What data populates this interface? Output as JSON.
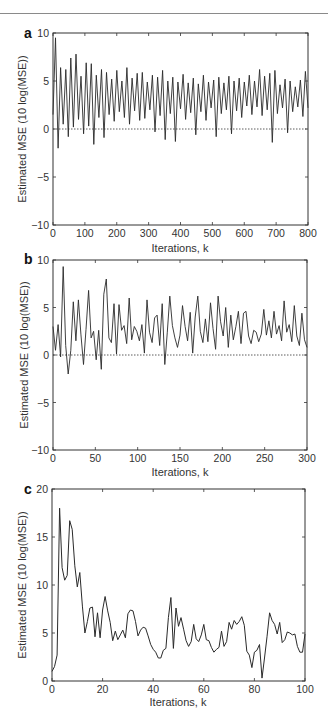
{
  "figure": {
    "panels": [
      "a",
      "b",
      "c"
    ]
  },
  "chart_data": [
    {
      "panel": "a",
      "type": "line",
      "title": "",
      "xlabel": "Iterations, k",
      "ylabel": "Estimated MSE  (10 log(MSE))",
      "xlim": [
        0,
        800
      ],
      "ylim": [
        -10,
        10
      ],
      "xticks": [
        0,
        100,
        200,
        300,
        400,
        500,
        600,
        700,
        800
      ],
      "yticks": [
        -10,
        -5,
        0,
        5,
        10
      ],
      "reference_line": {
        "y": 0,
        "style": "dotted"
      },
      "grid": false,
      "series": [
        {
          "name": "Estimated MSE",
          "description": "Highly oscillatory trace, peaks up to ~9.5 near k=10, typically oscillating between ~0 and ~6, occasional dips to ~-2",
          "x_step": 8,
          "values": [
            1.5,
            9.5,
            -2.0,
            6.4,
            0.5,
            6.2,
            -0.8,
            7.4,
            0.2,
            7.8,
            1.0,
            5.5,
            -0.5,
            6.9,
            0.3,
            6.8,
            -1.6,
            5.6,
            1.2,
            6.2,
            -0.9,
            5.9,
            1.5,
            5.2,
            0.8,
            6.1,
            1.8,
            5.0,
            1.2,
            6.4,
            0.5,
            5.3,
            1.9,
            5.8,
            0.9,
            5.9,
            1.1,
            4.9,
            2.0,
            5.6,
            -0.3,
            5.4,
            1.4,
            6.1,
            -1.1,
            5.0,
            1.6,
            5.4,
            -1.3,
            4.9,
            2.1,
            5.7,
            1.0,
            4.8,
            1.7,
            5.3,
            -0.6,
            4.7,
            1.8,
            5.6,
            0.9,
            4.9,
            2.2,
            5.1,
            -0.8,
            5.4,
            1.6,
            4.8,
            2.0,
            5.5,
            -0.5,
            5.0,
            1.9,
            5.3,
            1.2,
            4.9,
            2.4,
            5.6,
            1.5,
            5.0,
            2.3,
            6.2,
            1.4,
            5.5,
            2.0,
            5.8,
            -1.4,
            6.1,
            1.6,
            4.6,
            2.2,
            5.2,
            -0.4,
            5.0,
            1.8,
            4.4,
            2.3,
            5.1,
            1.3,
            6.0,
            2.2
          ]
        }
      ]
    },
    {
      "panel": "b",
      "type": "line",
      "title": "",
      "xlabel": "Iterations, k",
      "ylabel": "Estimated MSE  (10 log(MSE))",
      "xlim": [
        0,
        300
      ],
      "ylim": [
        -10,
        10
      ],
      "xticks": [
        0,
        50,
        100,
        150,
        200,
        250,
        300
      ],
      "yticks": [
        -10,
        -5,
        0,
        5,
        10
      ],
      "reference_line": {
        "y": 0,
        "style": "dotted"
      },
      "grid": false,
      "series": [
        {
          "name": "Estimated MSE",
          "x_step": 3,
          "values": [
            3.0,
            0.5,
            3.2,
            -0.2,
            9.3,
            1.0,
            -2.0,
            0.5,
            5.6,
            1.5,
            5.8,
            2.2,
            -1.0,
            2.7,
            6.8,
            1.8,
            2.5,
            -0.5,
            2.6,
            -1.5,
            6.4,
            8.0,
            1.8,
            1.3,
            5.4,
            0.1,
            5.3,
            2.6,
            3.1,
            1.2,
            6.0,
            1.6,
            3.0,
            2.5,
            1.5,
            3.2,
            0.2,
            5.8,
            2.4,
            1.3,
            3.9,
            4.2,
            1.0,
            5.4,
            -1.0,
            2.4,
            6.2,
            3.1,
            1.8,
            0.8,
            2.1,
            5.2,
            3.0,
            1.5,
            4.5,
            0.2,
            4.0,
            6.2,
            2.5,
            1.3,
            3.8,
            1.4,
            5.5,
            2.8,
            0.6,
            6.2,
            3.5,
            2.0,
            5.0,
            0.8,
            4.2,
            1.6,
            3.0,
            4.6,
            1.2,
            4.4,
            4.6,
            2.0,
            1.2,
            2.6,
            2.4,
            1.4,
            2.2,
            4.8,
            2.1,
            3.6,
            1.8,
            4.6,
            2.2,
            3.1,
            1.5,
            5.7,
            2.4,
            3.2,
            1.4,
            5.2,
            2.0,
            1.0,
            4.4,
            1.6,
            0.8
          ]
        }
      ]
    },
    {
      "panel": "c",
      "type": "line",
      "title": "",
      "xlabel": "Iterations, k",
      "ylabel": "Estimated MSE (10 log(MSE))",
      "xlim": [
        0,
        100
      ],
      "ylim": [
        0,
        20
      ],
      "xticks": [
        0,
        20,
        40,
        60,
        80,
        100
      ],
      "yticks": [
        0,
        5,
        10,
        15,
        20
      ],
      "grid": false,
      "series": [
        {
          "name": "Estimated MSE",
          "x_step": 1,
          "values": [
            1.0,
            1.5,
            2.7,
            18.0,
            11.8,
            10.5,
            11.0,
            16.7,
            15.8,
            12.0,
            9.8,
            11.3,
            7.8,
            5.0,
            6.2,
            7.6,
            7.7,
            4.6,
            7.1,
            4.5,
            7.4,
            8.8,
            7.3,
            6.1,
            4.2,
            5.2,
            4.3,
            4.8,
            5.3,
            4.5,
            7.0,
            7.4,
            7.3,
            6.2,
            4.7,
            5.3,
            5.6,
            5.5,
            4.7,
            3.8,
            3.3,
            3.0,
            2.4,
            2.4,
            3.2,
            3.4,
            6.6,
            8.7,
            3.4,
            7.6,
            5.7,
            6.6,
            5.4,
            4.2,
            3.6,
            4.1,
            5.9,
            4.4,
            4.1,
            4.8,
            5.9,
            4.3,
            4.2,
            3.5,
            3.0,
            3.3,
            3.5,
            5.2,
            3.6,
            4.1,
            6.1,
            5.4,
            6.3,
            5.9,
            6.2,
            6.7,
            5.8,
            3.1,
            2.7,
            1.4,
            3.0,
            3.2,
            3.8,
            0.3,
            2.4,
            4.6,
            7.1,
            6.3,
            5.9,
            4.9,
            6.1,
            4.0,
            4.3,
            5.1,
            5.0,
            4.8,
            4.9,
            3.6,
            3.0,
            3.0,
            4.9
          ]
        }
      ]
    }
  ]
}
